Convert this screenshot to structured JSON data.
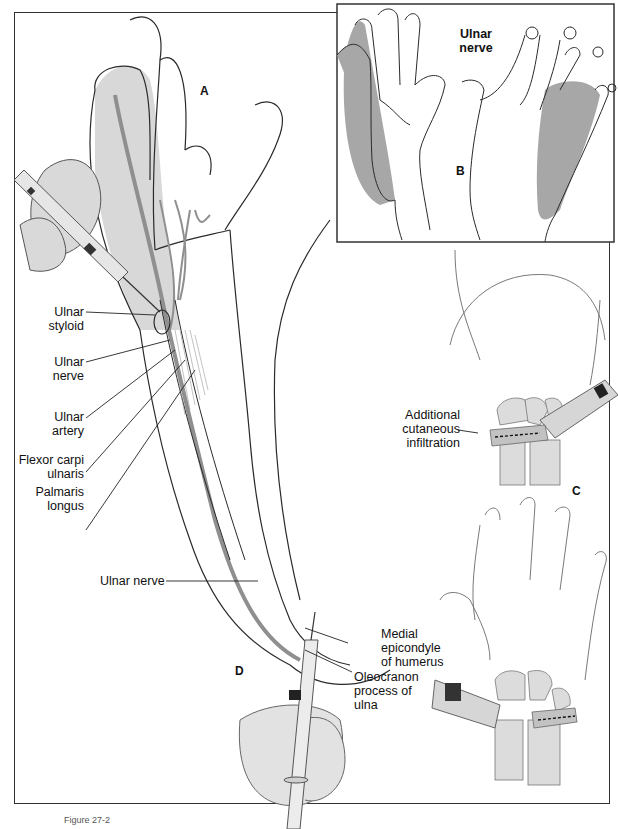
{
  "figure": {
    "caption": "Figure 27-2",
    "colors": {
      "line": "#2a2a2a",
      "nerve_gray": "#8f8f8f",
      "shade_gray": "#b8b8b8",
      "light_gray": "#dcdcdc",
      "background": "#ffffff"
    }
  },
  "panels": {
    "A": {
      "letter": "A"
    },
    "B": {
      "letter": "B",
      "title_line1": "Ulnar",
      "title_line2": "nerve"
    },
    "C": {
      "letter": "C",
      "label_line1": "Additional",
      "label_line2": "cutaneous",
      "label_line3": "infiltration"
    },
    "D": {
      "letter": "D"
    }
  },
  "labels_left": [
    {
      "line1": "Ulnar",
      "line2": "styloid"
    },
    {
      "line1": "Ulnar",
      "line2": "nerve"
    },
    {
      "line1": "Ulnar",
      "line2": "artery"
    },
    {
      "line1": "Flexor carpi",
      "line2": "ulnaris"
    },
    {
      "line1": "Palmaris",
      "line2": "longus"
    }
  ],
  "labels_elbow": {
    "ulnar_nerve": "Ulnar nerve",
    "medial_epicondyle": {
      "line1": "Medial",
      "line2": "epicondyle",
      "line3": "of humerus"
    },
    "olecranon": {
      "line1": "Oleocranon",
      "line2": "process of",
      "line3": "ulna"
    }
  }
}
